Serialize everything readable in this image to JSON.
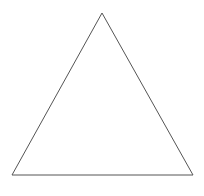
{
  "diagram": {
    "background": "#ffffff",
    "shape": {
      "type": "triangle",
      "kind": "equilateral-outline",
      "stroke": "#555555",
      "stroke_width": 1,
      "fill": "none",
      "vertices": [
        {
          "name": "apex",
          "x": 102,
          "y": 13
        },
        {
          "name": "bottom-left",
          "x": 12,
          "y": 175
        },
        {
          "name": "bottom-right",
          "x": 193,
          "y": 175
        }
      ]
    }
  }
}
